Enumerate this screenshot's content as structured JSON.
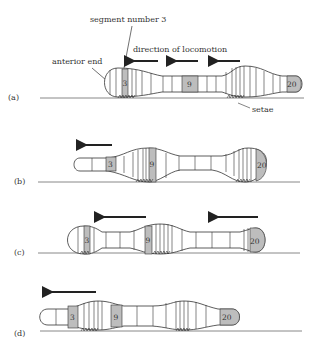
{
  "colors": {
    "line": "#3a3a3a",
    "shade": "#bdbdbd",
    "ground": "#6a6a6a",
    "background": "#ffffff"
  },
  "labels": {
    "segment_number": "segment number 3",
    "direction": "direction of locomotion",
    "anterior_end": "anterior end",
    "setae": "setae"
  },
  "panels": [
    {
      "id": "a",
      "label": "(a)",
      "seg3": "3",
      "seg9": "9",
      "seg20": "20"
    },
    {
      "id": "b",
      "label": "(b)",
      "seg3": "3",
      "seg9": "9",
      "seg20": "20"
    },
    {
      "id": "c",
      "label": "(c)",
      "seg3": "3",
      "seg9": "9",
      "seg20": "20"
    },
    {
      "id": "d",
      "label": "(d)",
      "seg3": "3",
      "seg9": "9",
      "seg20": "20"
    }
  ]
}
